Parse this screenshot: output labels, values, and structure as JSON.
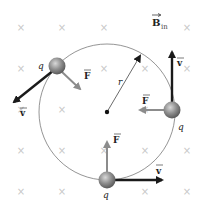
{
  "diagram": {
    "field_label": {
      "main": "B",
      "subscript": "in",
      "vector": true
    },
    "radius_label": "r",
    "charge_label": "q",
    "force_label": "F",
    "velocity_label": "v",
    "colors": {
      "background": "#ffffff",
      "field_x": "#c8c8c8",
      "circle": "#7a7a7a",
      "velocity_arrow": "#1a1a1a",
      "force_arrow": "#8c8c8c",
      "charge_sphere": "#8a8a8a",
      "text": "#222222"
    },
    "field_marks": {
      "symbol": "×",
      "columns": [
        21,
        62,
        104,
        145,
        187
      ],
      "rows": [
        28,
        69,
        110,
        151,
        192
      ]
    },
    "circle": {
      "cx": 107,
      "cy": 112,
      "r": 68
    },
    "charges": [
      {
        "id": "upper-left",
        "x": 57,
        "y": 66,
        "q_label": "q",
        "velocity": {
          "to_x": 12,
          "to_y": 104,
          "label": "v"
        },
        "force": {
          "to_x": 83,
          "to_y": 92,
          "label": "F"
        }
      },
      {
        "id": "right",
        "x": 172,
        "y": 110,
        "q_label": "q",
        "velocity": {
          "to_x": 172,
          "to_y": 48,
          "label": "v"
        },
        "force": {
          "to_x": 136,
          "to_y": 110,
          "label": "F"
        }
      },
      {
        "id": "bottom",
        "x": 107,
        "y": 180,
        "q_label": "q",
        "velocity": {
          "to_x": 166,
          "to_y": 180,
          "label": "v"
        },
        "force": {
          "to_x": 107,
          "to_y": 138,
          "label": "F"
        }
      }
    ]
  }
}
